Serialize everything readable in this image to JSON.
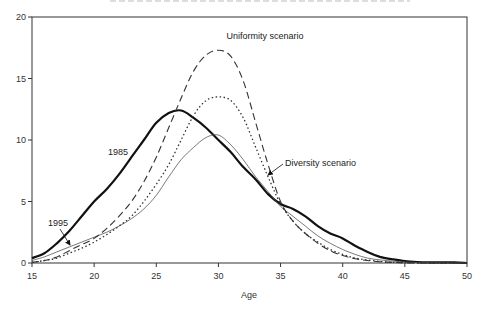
{
  "chart_data": {
    "type": "line",
    "title": "",
    "xlabel": "Age",
    "ylabel": "",
    "xlim": [
      15,
      50
    ],
    "ylim": [
      0,
      20
    ],
    "xticks": [
      15,
      20,
      25,
      30,
      35,
      40,
      45,
      50
    ],
    "yticks": [
      0,
      5,
      10,
      15,
      20
    ],
    "grid": false,
    "legend": "none (curves labeled by inline annotations)",
    "series": [
      {
        "name": "1985",
        "style": "solid-thick",
        "x": [
          15,
          16,
          17,
          18,
          19,
          20,
          21,
          22,
          23,
          24,
          25,
          26,
          27,
          28,
          29,
          30,
          31,
          32,
          33,
          34,
          35,
          36,
          37,
          38,
          39,
          40,
          41,
          42,
          43,
          44,
          45,
          46,
          47,
          48,
          49,
          50
        ],
        "values": [
          0.4,
          0.8,
          1.6,
          2.6,
          3.8,
          5.0,
          6.0,
          7.2,
          8.6,
          10.0,
          11.4,
          12.2,
          12.4,
          11.8,
          11.0,
          10.0,
          9.0,
          7.8,
          6.8,
          5.6,
          4.8,
          4.4,
          3.8,
          3.0,
          2.4,
          2.0,
          1.4,
          0.9,
          0.5,
          0.3,
          0.15,
          0.08,
          0.05,
          0.05,
          0.05,
          0.0
        ]
      },
      {
        "name": "1995",
        "style": "solid-thin",
        "x": [
          15,
          16,
          17,
          18,
          19,
          20,
          21,
          22,
          23,
          24,
          25,
          26,
          27,
          28,
          29,
          30,
          31,
          32,
          33,
          34,
          35,
          36,
          37,
          38,
          39,
          40,
          41,
          42,
          43,
          44,
          45,
          46,
          47,
          48,
          49,
          50
        ],
        "values": [
          0.2,
          0.5,
          0.9,
          1.3,
          1.7,
          2.1,
          2.5,
          3.0,
          3.6,
          4.4,
          5.5,
          7.0,
          8.4,
          9.4,
          10.2,
          10.4,
          9.6,
          8.4,
          7.0,
          5.8,
          4.6,
          3.8,
          3.0,
          2.2,
          1.6,
          1.1,
          0.7,
          0.4,
          0.25,
          0.15,
          0.08,
          0.04,
          0.02,
          0.01,
          0.0,
          0.0
        ]
      },
      {
        "name": "Uniformity scenario",
        "style": "dashed",
        "x": [
          15,
          16,
          17,
          18,
          19,
          20,
          21,
          22,
          23,
          24,
          25,
          26,
          27,
          28,
          29,
          30,
          31,
          32,
          33,
          34,
          35,
          36,
          37,
          38,
          39,
          40,
          41,
          42,
          43,
          44,
          45,
          46,
          47,
          48,
          49,
          50
        ],
        "values": [
          0.05,
          0.2,
          0.5,
          1.0,
          1.5,
          2.0,
          2.8,
          3.8,
          5.0,
          6.6,
          8.6,
          11.0,
          13.4,
          15.6,
          16.9,
          17.3,
          16.8,
          14.8,
          11.4,
          8.0,
          5.0,
          3.4,
          2.4,
          1.6,
          1.0,
          0.6,
          0.35,
          0.2,
          0.1,
          0.05,
          0.02,
          0.0,
          0.0,
          0.0,
          0.0,
          0.0
        ]
      },
      {
        "name": "Diversity scenario",
        "style": "dotted",
        "x": [
          15,
          16,
          17,
          18,
          19,
          20,
          21,
          22,
          23,
          24,
          25,
          26,
          27,
          28,
          29,
          30,
          31,
          32,
          33,
          34,
          35,
          36,
          37,
          38,
          39,
          40,
          41,
          42,
          43,
          44,
          45,
          46,
          47,
          48,
          49,
          50
        ],
        "values": [
          0.05,
          0.2,
          0.4,
          0.8,
          1.2,
          1.7,
          2.3,
          3.0,
          3.8,
          5.0,
          6.4,
          8.0,
          10.0,
          12.0,
          13.2,
          13.5,
          13.2,
          11.8,
          9.4,
          7.0,
          4.8,
          3.4,
          2.4,
          1.7,
          1.1,
          0.7,
          0.4,
          0.25,
          0.12,
          0.06,
          0.03,
          0.0,
          0.0,
          0.0,
          0.0,
          0.0
        ]
      }
    ],
    "annotations": [
      {
        "text": "Uniformity scenario",
        "x": 30.5,
        "y": 18.3
      },
      {
        "text": "Diversity scenario",
        "x": 34.5,
        "y": 11.3,
        "arrow_to": [
          32.3,
          10.0
        ]
      },
      {
        "text": "1985",
        "x": 22.3,
        "y": 9.0
      },
      {
        "text": "1995",
        "x": 17.6,
        "y": 3.0,
        "arrow_to": [
          18.4,
          1.4
        ]
      }
    ]
  },
  "axes": {
    "x_title": "Age",
    "x_tick_labels": [
      "15",
      "20",
      "25",
      "30",
      "35",
      "40",
      "45",
      "50"
    ],
    "y_tick_labels": [
      "0",
      "5",
      "10",
      "15",
      "20"
    ]
  },
  "labels": {
    "uniformity": "Uniformity scenario",
    "diversity": "Diversity scenario",
    "y1985": "1985",
    "y1995": "1995"
  }
}
